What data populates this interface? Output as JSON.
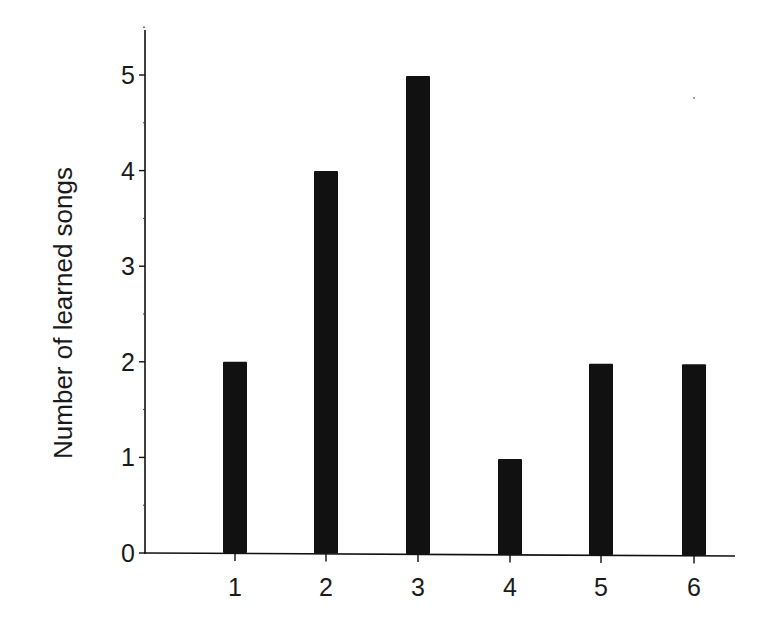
{
  "chart_data": {
    "type": "bar",
    "title": "",
    "xlabel": "",
    "ylabel": "Number of learned songs",
    "categories": [
      "1",
      "2",
      "3",
      "4",
      "5",
      "6"
    ],
    "values": [
      2,
      4,
      5,
      1,
      2,
      2
    ],
    "yticks": [
      "0",
      "1",
      "2",
      "3",
      "4",
      "5"
    ],
    "ylim": [
      0,
      5.5
    ],
    "grid": false,
    "legend": null,
    "bar_color": "#111111"
  }
}
